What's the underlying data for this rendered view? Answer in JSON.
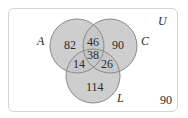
{
  "diagram": {
    "type": "venn-3",
    "universe_label": "U",
    "sets": [
      {
        "id": "A",
        "label": "A"
      },
      {
        "id": "C",
        "label": "C"
      },
      {
        "id": "L",
        "label": "L"
      }
    ],
    "regions": {
      "A_only": "82",
      "C_only": "90",
      "L_only": "114",
      "A_and_C_only": "46",
      "A_and_L_only": "14",
      "C_and_L_only": "26",
      "A_and_C_and_L": "38",
      "outside": "90"
    },
    "colors": {
      "circle_fill": "#c6c6c6",
      "circle_stroke": "#8a8a8a",
      "frame_border": "#d4d4d4",
      "text": "#2a2a2a"
    }
  }
}
